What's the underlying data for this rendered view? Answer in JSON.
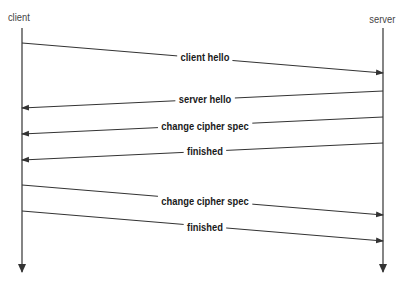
{
  "diagram": {
    "type": "sequence",
    "actors": [
      {
        "id": "client",
        "label": "client",
        "x": 22
      },
      {
        "id": "server",
        "label": "server",
        "x": 383
      }
    ],
    "lifeline": {
      "top": 28,
      "bottom": 272
    },
    "messages": [
      {
        "label": "client hello",
        "from": "client",
        "to": "server",
        "y_start": 43,
        "y_end": 73,
        "label_y": 57
      },
      {
        "label": "server hello",
        "from": "server",
        "to": "client",
        "y_start": 91,
        "y_end": 108,
        "label_y": 99
      },
      {
        "label": "change cipher spec",
        "from": "server",
        "to": "client",
        "y_start": 117,
        "y_end": 134,
        "label_y": 126
      },
      {
        "label": "finished",
        "from": "server",
        "to": "client",
        "y_start": 143,
        "y_end": 160,
        "label_y": 151
      },
      {
        "label": "change cipher spec",
        "from": "client",
        "to": "server",
        "y_start": 185,
        "y_end": 215,
        "label_y": 201
      },
      {
        "label": "finished",
        "from": "client",
        "to": "server",
        "y_start": 211,
        "y_end": 241,
        "label_y": 227
      }
    ],
    "colors": {
      "line": "#333333",
      "label": "#1a1a1a",
      "actor_label": "#444444",
      "background": "#ffffff"
    }
  }
}
